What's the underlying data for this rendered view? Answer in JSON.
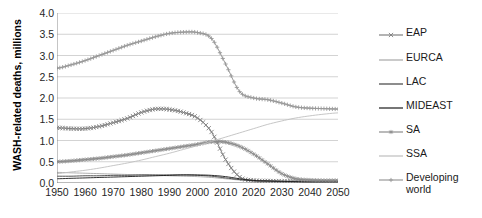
{
  "chart_data": {
    "type": "line",
    "title": "",
    "xlabel": "",
    "ylabel": "WASH-related deaths, millions",
    "xlim": [
      1950,
      2050
    ],
    "ylim": [
      0.0,
      4.0
    ],
    "grid": true,
    "legend_position": "right",
    "x_ticks": [
      "1950",
      "1960",
      "1970",
      "1980",
      "1990",
      "2000",
      "2010",
      "2020",
      "2030",
      "2040",
      "2050"
    ],
    "y_ticks": [
      "0.0",
      "0.5",
      "1.0",
      "1.5",
      "2.0",
      "2.5",
      "3.0",
      "3.5",
      "4.0"
    ],
    "x": [
      1950,
      1955,
      1960,
      1965,
      1970,
      1975,
      1980,
      1985,
      1990,
      1995,
      2000,
      2005,
      2010,
      2015,
      2020,
      2025,
      2030,
      2035,
      2040,
      2045,
      2050
    ],
    "series": [
      {
        "name": "EAP",
        "color": "#808080",
        "marker": "x",
        "values": [
          1.3,
          1.28,
          1.28,
          1.33,
          1.42,
          1.52,
          1.66,
          1.74,
          1.73,
          1.66,
          1.53,
          1.2,
          0.55,
          0.14,
          0.06,
          0.05,
          0.04,
          0.04,
          0.03,
          0.03,
          0.03
        ]
      },
      {
        "name": "EURCA",
        "color": "#a6a6a6",
        "marker": "none",
        "values": [
          0.25,
          0.24,
          0.23,
          0.22,
          0.21,
          0.2,
          0.19,
          0.18,
          0.17,
          0.16,
          0.15,
          0.13,
          0.1,
          0.07,
          0.05,
          0.04,
          0.03,
          0.03,
          0.02,
          0.02,
          0.02
        ]
      },
      {
        "name": "LAC",
        "color": "#404040",
        "marker": "none",
        "values": [
          0.16,
          0.16,
          0.17,
          0.17,
          0.18,
          0.18,
          0.19,
          0.19,
          0.19,
          0.19,
          0.18,
          0.16,
          0.12,
          0.08,
          0.05,
          0.04,
          0.03,
          0.03,
          0.02,
          0.02,
          0.02
        ]
      },
      {
        "name": "MIDEAST",
        "color": "#1a1a1a",
        "marker": "none",
        "values": [
          0.1,
          0.11,
          0.12,
          0.13,
          0.14,
          0.15,
          0.16,
          0.17,
          0.18,
          0.19,
          0.19,
          0.18,
          0.15,
          0.1,
          0.06,
          0.05,
          0.04,
          0.03,
          0.03,
          0.03,
          0.03
        ]
      },
      {
        "name": "SA",
        "color": "#8c8c8c",
        "marker": "star",
        "values": [
          0.5,
          0.52,
          0.55,
          0.58,
          0.62,
          0.66,
          0.71,
          0.76,
          0.81,
          0.86,
          0.91,
          0.97,
          0.96,
          0.86,
          0.68,
          0.45,
          0.22,
          0.1,
          0.07,
          0.06,
          0.06
        ]
      },
      {
        "name": "SSA",
        "color": "#bfbfbf",
        "marker": "none",
        "values": [
          0.22,
          0.26,
          0.3,
          0.35,
          0.41,
          0.47,
          0.54,
          0.62,
          0.7,
          0.79,
          0.88,
          0.98,
          1.08,
          1.18,
          1.28,
          1.38,
          1.46,
          1.53,
          1.58,
          1.62,
          1.65
        ]
      },
      {
        "name": "Developing\nworld",
        "color": "#999999",
        "marker": "plus",
        "values": [
          2.7,
          2.78,
          2.88,
          3.0,
          3.12,
          3.24,
          3.34,
          3.44,
          3.52,
          3.55,
          3.54,
          3.4,
          2.8,
          2.15,
          2.0,
          1.96,
          1.88,
          1.79,
          1.76,
          1.75,
          1.74
        ]
      }
    ]
  },
  "legend": {
    "entries": [
      {
        "label": "EAP",
        "marker": "x",
        "color": "#808080"
      },
      {
        "label": "EURCA",
        "marker": "none",
        "color": "#a6a6a6"
      },
      {
        "label": "LAC",
        "marker": "none",
        "color": "#404040"
      },
      {
        "label": "MIDEAST",
        "marker": "none",
        "color": "#1a1a1a"
      },
      {
        "label": "SA",
        "marker": "star",
        "color": "#8c8c8c"
      },
      {
        "label": "SSA",
        "marker": "none",
        "color": "#bfbfbf"
      },
      {
        "label": "Developing\nworld",
        "marker": "plus",
        "color": "#999999"
      }
    ]
  },
  "axis": {
    "y_title": "WASH-related deaths,\nmillions"
  },
  "colors": {
    "gridline": "#c8c8c8",
    "axis": "#808080",
    "text": "#1a1a1a",
    "background": "#ffffff"
  }
}
